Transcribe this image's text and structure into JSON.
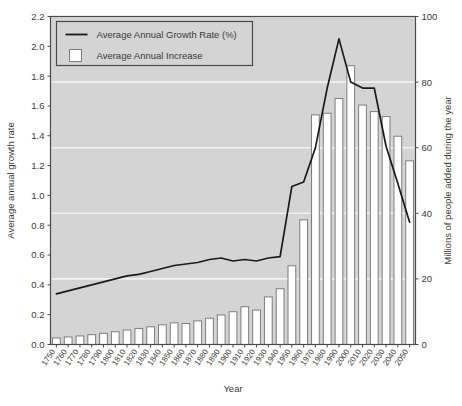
{
  "chart_data": {
    "type": "bar",
    "title": "",
    "xlabel": "Year",
    "ylabel": "Average annual growth rate",
    "y2label": "Millions of people added during the year",
    "ylim": [
      0.0,
      2.2
    ],
    "y2lim": [
      0,
      100
    ],
    "xlim": [
      1750,
      2050
    ],
    "grid": true,
    "legend_position": "top-left",
    "categories": [
      "1750",
      "1760",
      "1770",
      "1780",
      "1790",
      "1800",
      "1810",
      "1820",
      "1830",
      "1840",
      "1850",
      "1860",
      "1870",
      "1880",
      "1890",
      "1900",
      "1910",
      "1920",
      "1930",
      "1940",
      "1950",
      "1960",
      "1970",
      "1980",
      "1990",
      "2000",
      "2010",
      "2020",
      "2030",
      "2040",
      "2050"
    ],
    "yticks": [
      "0.0",
      "0.2",
      "0.4",
      "0.6",
      "0.8",
      "1.0",
      "1.2",
      "1.4",
      "1.6",
      "1.8",
      "2.0",
      "2.2"
    ],
    "y2ticks": [
      "0",
      "20",
      "40",
      "60",
      "80",
      "100"
    ],
    "series": [
      {
        "name": "Average Annual Increase",
        "type": "bar",
        "axis": "right",
        "unit": "millions",
        "values": [
          2.0,
          2.3,
          2.6,
          3.0,
          3.4,
          3.9,
          4.4,
          4.9,
          5.4,
          6.0,
          6.6,
          6.4,
          7.2,
          8.0,
          9.0,
          10.0,
          11.5,
          10.5,
          14.5,
          17.0,
          24.0,
          38.0,
          70.0,
          70.5,
          75.0,
          85.0,
          73.0,
          71.0,
          69.5,
          63.5,
          56.0
        ]
      },
      {
        "name": "Average Annual Growth Rate (%)",
        "type": "line",
        "axis": "left",
        "unit": "percent",
        "values": [
          0.34,
          0.36,
          0.38,
          0.4,
          0.42,
          0.44,
          0.46,
          0.47,
          0.49,
          0.51,
          0.53,
          0.54,
          0.55,
          0.57,
          0.58,
          0.56,
          0.57,
          0.56,
          0.58,
          0.59,
          1.06,
          1.09,
          1.32,
          1.72,
          2.05,
          1.76,
          1.72,
          1.72,
          1.33,
          1.08,
          0.82
        ],
        "extra_point_values": [
          0.34,
          0.62
        ]
      }
    ],
    "legend": [
      {
        "label": "Average Annual Growth Rate (%)",
        "marker": "line"
      },
      {
        "label": "Average Annual Increase",
        "marker": "box"
      }
    ],
    "colors": {
      "plot_background": "#d4d4d4",
      "gridline": "#f2f2f2",
      "bar_fill": "#ffffff",
      "bar_stroke": "#7d7d7d",
      "line_stroke": "#1a1a1a",
      "axis_stroke": "#4a4a4a",
      "text": "#3a3a3a",
      "legend_background": "#d4d4d4",
      "legend_border": "#4a4a4a",
      "page_background": "#ffffff"
    }
  }
}
